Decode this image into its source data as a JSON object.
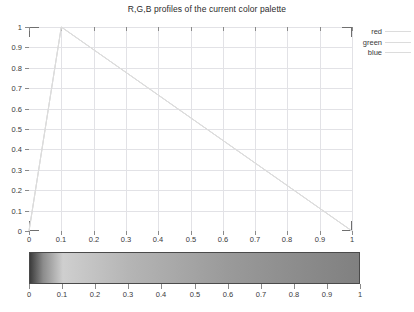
{
  "chart_data": {
    "type": "line",
    "title": "R,G,B profiles of the current color palette",
    "xlabel": "",
    "ylabel": "",
    "xlim": [
      0,
      1
    ],
    "ylim": [
      0,
      1
    ],
    "grid": true,
    "legend_position": "top-right-outside",
    "x_ticks": [
      "0",
      "0.1",
      "0.2",
      "0.3",
      "0.4",
      "0.5",
      "0.6",
      "0.7",
      "0.8",
      "0.9",
      "1"
    ],
    "y_ticks": [
      "0",
      "0.1",
      "0.2",
      "0.3",
      "0.4",
      "0.5",
      "0.6",
      "0.7",
      "0.8",
      "0.9",
      "1"
    ],
    "x": [
      0,
      0.1,
      1
    ],
    "series": [
      {
        "name": "red",
        "values": [
          0,
          1,
          0
        ],
        "color": "#dcdcdc"
      },
      {
        "name": "green",
        "values": [
          0,
          1,
          0
        ],
        "color": "#dcdcdc"
      },
      {
        "name": "blue",
        "values": [
          0,
          1,
          0
        ],
        "color": "#dcdcdc"
      }
    ],
    "note": "All three R,G,B profiles are identical and overlap exactly (grayscale palette)."
  },
  "legend": {
    "entries": [
      {
        "label": "red"
      },
      {
        "label": "green"
      },
      {
        "label": "blue"
      }
    ]
  },
  "colorbar": {
    "type": "gradient-strip",
    "xlim": [
      0,
      1
    ],
    "ticks": [
      "0",
      "0.1",
      "0.2",
      "0.3",
      "0.4",
      "0.5",
      "0.6",
      "0.7",
      "0.8",
      "0.9",
      "1"
    ],
    "stops": [
      {
        "pos": 0.0,
        "color": "#3c3c3c"
      },
      {
        "pos": 0.04,
        "color": "#8c8c8c"
      },
      {
        "pos": 0.1,
        "color": "#cfcfcf"
      },
      {
        "pos": 0.3,
        "color": "#b5b5b5"
      },
      {
        "pos": 0.6,
        "color": "#9a9a9a"
      },
      {
        "pos": 1.0,
        "color": "#808080"
      }
    ]
  },
  "colors": {
    "background": "#ffffff",
    "grid": "#e2e2e6",
    "axis": "#6f6f6f",
    "text": "#3a3a3a",
    "line": "#dcdcdc"
  }
}
